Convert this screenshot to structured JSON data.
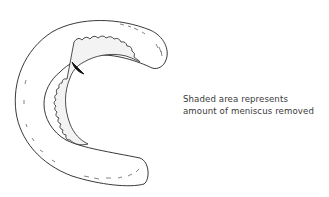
{
  "diagram": {
    "subject": "meniscus",
    "caption": {
      "line1": "Shaded area represents",
      "line2": "amount of meniscus removed"
    },
    "colors": {
      "outline": "#222222",
      "shaded": "#f3f3f3",
      "background": "#ffffff",
      "text": "#3a3a3a"
    }
  }
}
